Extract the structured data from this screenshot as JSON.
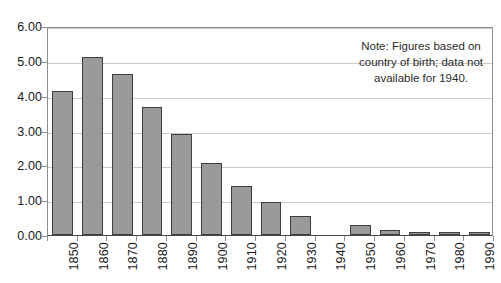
{
  "chart_data": {
    "type": "bar",
    "title": "",
    "xlabel": "",
    "ylabel": "",
    "categories": [
      "1850",
      "1860",
      "1870",
      "1880",
      "1890",
      "1900",
      "1910",
      "1920",
      "1930",
      "1940",
      "1950",
      "1960",
      "1970",
      "1980",
      "1990"
    ],
    "values": [
      4.14,
      5.11,
      4.62,
      3.67,
      2.9,
      2.08,
      1.42,
      0.95,
      0.55,
      null,
      0.28,
      0.15,
      0.06,
      0.04,
      0.04
    ],
    "ylim": [
      0,
      6
    ],
    "ytick_values": [
      0,
      1,
      2,
      3,
      4,
      5,
      6
    ],
    "ytick_labels": [
      "0.00",
      "1.00",
      "2.00",
      "3.00",
      "4.00",
      "5.00",
      "6.00"
    ],
    "grid": true,
    "legend": false,
    "annotations": [
      {
        "name": "note",
        "lines": [
          "Note: Figures based on",
          "country of birth; data not",
          "available for 1940."
        ],
        "text": "Note: Figures based on country of birth; data not available for 1940."
      }
    ],
    "colors": {
      "bar_fill": "#9a9a9a",
      "bar_border": "#3d3d3d",
      "gridline": "#c9c9c9",
      "axis": "#4a4a4a",
      "background": "#ffffff",
      "text": "#1a1a1a"
    }
  }
}
